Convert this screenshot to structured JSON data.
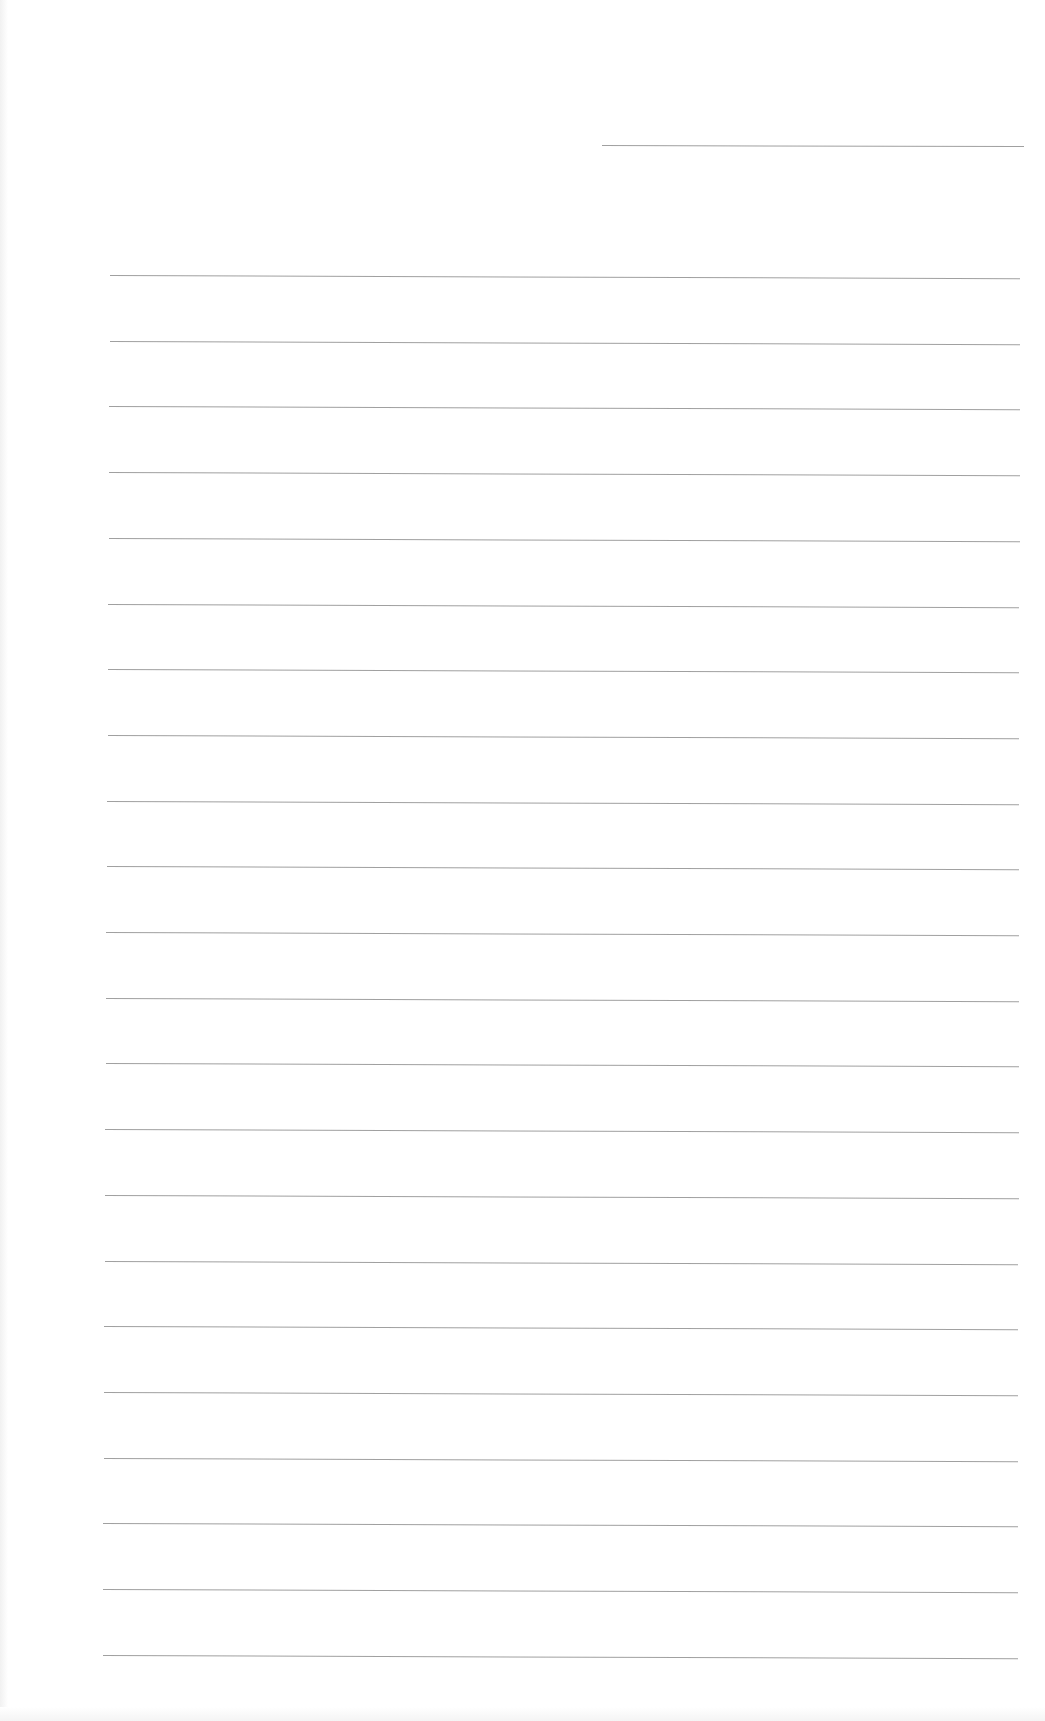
{
  "document": {
    "type": "blank lined sheet",
    "text": "",
    "header_rule": {
      "x_start": 602,
      "x_end": 1024,
      "y": 145
    },
    "rules": {
      "count": 22,
      "first_y": 275,
      "spacing": 65.7,
      "x_start": 110,
      "x_end": 1020,
      "color": "#8f8f8f"
    }
  }
}
